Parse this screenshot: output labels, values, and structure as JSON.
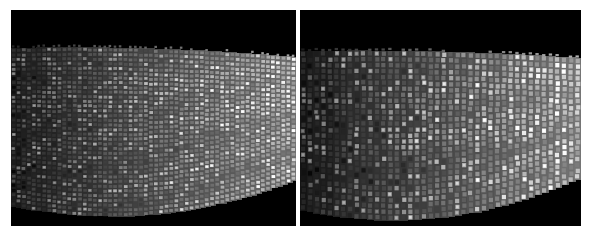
{
  "figure": {
    "background_color": "#ffffff",
    "width": 593,
    "height": 243
  },
  "panels": [
    {
      "id": "left-panel",
      "label": "Left panel",
      "x": 11,
      "y": 10,
      "width": 285,
      "height": 216,
      "background_color": "#000000",
      "tile_style": "wide",
      "band": {
        "top_left_y": 38,
        "top_right_y": 47,
        "top_sag": -4,
        "bottom_left_y": 196,
        "bottom_right_y": 170,
        "bottom_sag": 22
      },
      "tiles": {
        "columns": 56,
        "rows": 34,
        "cell_width": 5.1,
        "cell_height": 4.7,
        "fill_ratio_x": 0.72,
        "fill_ratio_y": 0.62
      },
      "gradient": {
        "left_luminance": 40,
        "right_luminance": 178,
        "tile_highlight_boost": 62,
        "noise_amplitude": 26
      }
    },
    {
      "id": "right-panel",
      "label": "Right panel",
      "x": 300,
      "y": 10,
      "width": 281,
      "height": 216,
      "background_color": "#000000",
      "tile_style": "tall",
      "band": {
        "top_left_y": 41,
        "top_right_y": 48,
        "top_sag": -3,
        "bottom_left_y": 200,
        "bottom_right_y": 168,
        "bottom_sag": 24
      },
      "tiles": {
        "columns": 42,
        "rows": 27,
        "cell_width": 6.7,
        "cell_height": 5.9,
        "fill_ratio_x": 0.62,
        "fill_ratio_y": 0.74
      },
      "gradient": {
        "left_luminance": 34,
        "right_luminance": 186,
        "tile_highlight_boost": 70,
        "noise_amplitude": 30
      }
    }
  ],
  "separator": {
    "id": "panel-separator",
    "x": 296,
    "y": 10,
    "width": 4,
    "height": 216,
    "color": "#ffffff"
  },
  "chart_data": {
    "type": "heatmap",
    "xlabel": "",
    "ylabel": "",
    "grid": false,
    "legend": "none",
    "panels": [
      "Left panel",
      "Right panel"
    ],
    "series": [
      {
        "name": "Left panel mean tile brightness by column (0-255)",
        "x": [
          0,
          10,
          20,
          30,
          40,
          50,
          60,
          70,
          80,
          90,
          100
        ],
        "values": [
          40,
          54,
          69,
          83,
          96,
          110,
          124,
          137,
          150,
          164,
          178
        ]
      },
      {
        "name": "Right panel mean tile brightness by column (0-255)",
        "x": [
          0,
          10,
          20,
          30,
          40,
          50,
          60,
          70,
          80,
          90,
          100
        ],
        "values": [
          34,
          49,
          64,
          80,
          95,
          110,
          125,
          141,
          156,
          171,
          186
        ]
      }
    ],
    "xlim": [
      0,
      100
    ],
    "ylim": [
      0,
      255
    ]
  }
}
